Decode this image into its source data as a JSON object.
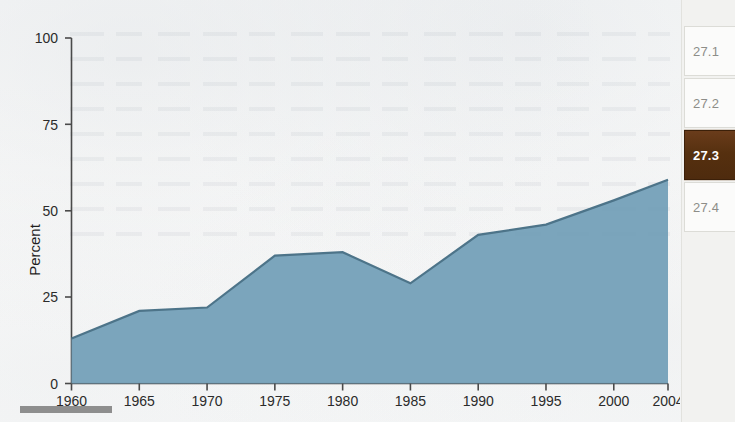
{
  "chart_data": {
    "type": "area",
    "title": "",
    "xlabel": "",
    "ylabel": "Percent",
    "categories": [
      1960,
      1965,
      1970,
      1975,
      1980,
      1985,
      1990,
      1995,
      2000,
      2004
    ],
    "x_tick_labels": [
      "1960",
      "1965",
      "1970",
      "1975",
      "1980",
      "1985",
      "1990",
      "1995",
      "2000",
      "2004"
    ],
    "values": [
      13,
      21,
      22,
      37,
      38,
      29,
      43,
      46,
      53,
      59
    ],
    "y_tick_labels": [
      "0",
      "25",
      "50",
      "75",
      "100"
    ],
    "y_ticks": [
      0,
      25,
      50,
      75,
      100
    ],
    "ylim": [
      0,
      100
    ],
    "xlim": [
      1960,
      2004
    ],
    "grid": false,
    "legend": "none",
    "area_color": "#74a0b8",
    "line_color": "#4d7489"
  },
  "axis": {
    "y_title": "Percent"
  },
  "tabs": {
    "active_index": 2,
    "items": [
      {
        "label": "27.1"
      },
      {
        "label": "27.2"
      },
      {
        "label": "27.3"
      },
      {
        "label": "27.4"
      }
    ]
  }
}
